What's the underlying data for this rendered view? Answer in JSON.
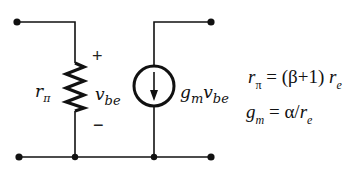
{
  "diagram": {
    "colors": {
      "wire": "#111111",
      "background": "#ffffff"
    },
    "components": {
      "resistor": {
        "symbol": "r",
        "subscript": "π"
      },
      "voltage": {
        "symbol": "v",
        "subscript": "be",
        "plus": "+",
        "minus": "−"
      },
      "current_source": {
        "g": "g",
        "g_sub": "m",
        "v": "v",
        "v_sub": "be"
      }
    },
    "equations": {
      "eq1": {
        "lhs": "r",
        "lhs_sub": "π",
        "mid": "= (β+1)",
        "rhs": "r",
        "rhs_sub": "e"
      },
      "eq2": {
        "lhs": "g",
        "lhs_sub": "m",
        "mid": "= α/",
        "rhs": "r",
        "rhs_sub": "e"
      }
    }
  }
}
